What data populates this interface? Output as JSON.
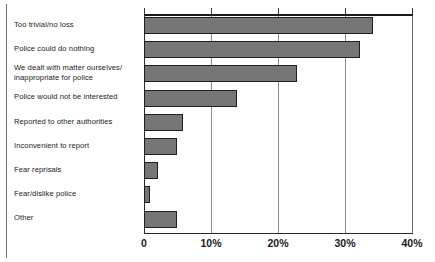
{
  "chart_data": {
    "type": "bar",
    "orientation": "horizontal",
    "title": "",
    "xlabel": "",
    "ylabel": "",
    "xlim": [
      0,
      40
    ],
    "grid": true,
    "legend": false,
    "categories": [
      "Too trivial/no loss",
      "Police could do nothing",
      "We dealt with matter ourselves/\ninappropriate for police",
      "Police would not be interested",
      "Reported to other authorities",
      "Inconvenient to report",
      "Fear reprisals",
      "Fear/dislike police",
      "Other"
    ],
    "values": [
      34.2,
      32.2,
      22.8,
      13.9,
      5.8,
      4.9,
      2.1,
      0.9,
      4.9
    ],
    "tick_labels": [
      "0",
      "10%",
      "20%",
      "30%",
      "40%"
    ],
    "tick_values": [
      0,
      10,
      20,
      30,
      40
    ],
    "bar_color": "#767676",
    "bar_edge_color": "#1f1f1f",
    "axis_color": "#1a1a1a",
    "grid_color": "#8c8c8c"
  }
}
